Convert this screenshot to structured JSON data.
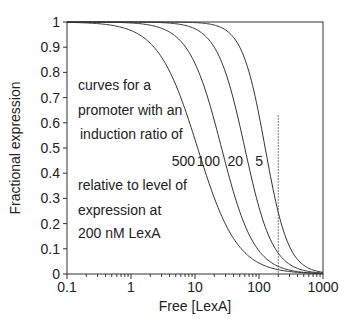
{
  "chart_data": {
    "type": "line",
    "title": "",
    "xlabel": "Free [LexA]",
    "ylabel": "Fractional expression",
    "xscale": "log",
    "xlim": [
      0.1,
      1000
    ],
    "ylim": [
      0,
      1
    ],
    "xticks": [
      "0.1",
      "1",
      "10",
      "100",
      "1000"
    ],
    "yticks": [
      "0",
      "0.1",
      "0.2",
      "0.3",
      "0.4",
      "0.5",
      "0.6",
      "0.7",
      "0.8",
      "0.9",
      "1"
    ],
    "grid": false,
    "series": [
      {
        "name": "500",
        "ratio": 500,
        "midpoint": 11,
        "hill": 1.4
      },
      {
        "name": "100",
        "ratio": 100,
        "midpoint": 26,
        "hill": 1.7
      },
      {
        "name": "20",
        "ratio": 20,
        "midpoint": 60,
        "hill": 2.0
      },
      {
        "name": "5",
        "ratio": 5,
        "midpoint": 125,
        "hill": 2.4
      }
    ],
    "reference_line": {
      "x": 200,
      "style": "dotted",
      "y_top": 0.63
    },
    "annotations": [
      "curves for a",
      "promoter with an",
      "induction ratio of",
      "relative to level of",
      "expression at",
      "200 nM LexA"
    ]
  }
}
